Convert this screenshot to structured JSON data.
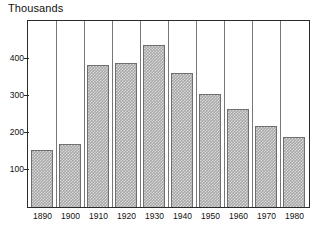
{
  "chart_data": {
    "type": "bar",
    "title": "Thousands",
    "xlabel": "",
    "ylabel": "",
    "categories": [
      "1890",
      "1900",
      "1910",
      "1920",
      "1930",
      "1940",
      "1950",
      "1960",
      "1970",
      "1980"
    ],
    "values": [
      155,
      170,
      383,
      390,
      437,
      363,
      305,
      265,
      220,
      190
    ],
    "ylim": [
      0,
      500
    ],
    "yticks": [
      100,
      200,
      300,
      400
    ],
    "ytick_labels": [
      "100",
      "200",
      "300",
      "400"
    ],
    "grid": "vertical-category-separators",
    "legend": "none",
    "series": [
      {
        "name": "Thousands",
        "values": [
          155,
          170,
          383,
          390,
          437,
          363,
          305,
          265,
          220,
          190
        ]
      }
    ],
    "colors": {
      "bar_fill": "#a8a8a8",
      "bar_border": "#6f6f6f",
      "frame": "#2b2b2b",
      "gridline": "#777777",
      "text": "#111111",
      "background": "#ffffff"
    }
  }
}
